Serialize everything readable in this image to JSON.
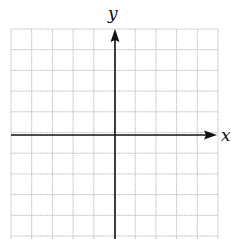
{
  "diagram": {
    "type": "coordinate-grid",
    "x_axis_label": "x",
    "y_axis_label": "y",
    "grid": {
      "columns": 10,
      "rows_visible": 10,
      "left": 11,
      "top": 29,
      "right": 218,
      "bottom": 239,
      "cell_size": 20.7,
      "line_color": "#bdbdbd",
      "axis_color": "#111111"
    },
    "origin_px": {
      "x": 115,
      "y": 135
    }
  }
}
